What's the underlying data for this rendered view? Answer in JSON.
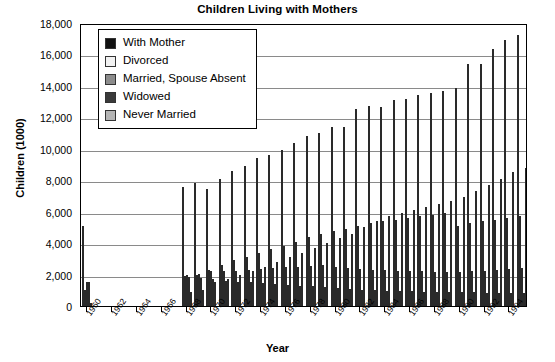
{
  "chart_data": {
    "type": "bar",
    "title": "Children Living with Mothers",
    "xlabel": "Year",
    "ylabel": "Children (1000)",
    "ylim": [
      0,
      18000
    ],
    "ytick_step": 2000,
    "grid": true,
    "legend_position": "top-left-inside",
    "xtick_labels": [
      "1960",
      "1962",
      "1964",
      "1966",
      "1968",
      "1970",
      "1972",
      "1974",
      "1976",
      "1978",
      "1980",
      "1982",
      "1984",
      "1986",
      "1988",
      "1990",
      "1992",
      "1994"
    ],
    "ytick_labels": [
      "0",
      "2,000",
      "4,000",
      "6,000",
      "8,000",
      "10,000",
      "12,000",
      "14,000",
      "16,000",
      "18,000"
    ],
    "x": [
      1960,
      1961,
      1962,
      1963,
      1964,
      1965,
      1966,
      1967,
      1968,
      1969,
      1970,
      1971,
      1972,
      1973,
      1974,
      1975,
      1976,
      1977,
      1978,
      1979,
      1980,
      1981,
      1982,
      1983,
      1984,
      1985,
      1986,
      1987,
      1988,
      1989,
      1990,
      1991,
      1992,
      1993,
      1994,
      1995
    ],
    "colors": {
      "with_mother": "#111111",
      "divorced": "#f2f2f2",
      "married_spouse_absent": "#8c8c8c",
      "widowed": "#3a3a3a",
      "never_married": "#b5b5b5"
    },
    "series": [
      {
        "name": "With Mother",
        "color": "#111111",
        "values": [
          5105,
          null,
          null,
          null,
          null,
          null,
          null,
          null,
          7600,
          7800,
          7452,
          8100,
          8600,
          8900,
          9400,
          9625,
          9900,
          10400,
          10800,
          11000,
          11406,
          11416,
          12512,
          12739,
          12646,
          13081,
          13180,
          13420,
          13521,
          13700,
          13874,
          15396,
          15396,
          16334,
          16896,
          17250
        ]
      },
      {
        "name": "Divorced",
        "color": "#f2f2f2",
        "values": [
          1050,
          null,
          null,
          null,
          null,
          null,
          null,
          null,
          1900,
          2000,
          2296,
          2600,
          2900,
          3100,
          3400,
          3600,
          3800,
          4100,
          4400,
          4600,
          4766,
          4900,
          5100,
          5300,
          5400,
          5500,
          5600,
          5700,
          5800,
          5900,
          5118,
          5300,
          5400,
          5500,
          5600,
          5700
        ]
      },
      {
        "name": "Married, Spouse Absent",
        "color": "#8c8c8c",
        "values": [
          1500,
          null,
          null,
          null,
          null,
          null,
          null,
          null,
          2000,
          2050,
          2223,
          2200,
          2250,
          2300,
          2350,
          2400,
          2450,
          2500,
          2550,
          2600,
          2480,
          2400,
          2350,
          2300,
          2280,
          2250,
          2220,
          2200,
          2180,
          2160,
          2178,
          2200,
          2250,
          2300,
          2350,
          2400
        ]
      },
      {
        "name": "Widowed",
        "color": "#3a3a3a",
        "values": [
          1500,
          null,
          null,
          null,
          null,
          null,
          null,
          null,
          1850,
          1800,
          1688,
          1600,
          1550,
          1500,
          1450,
          1400,
          1350,
          1300,
          1250,
          1200,
          1163,
          1100,
          1050,
          1000,
          980,
          960,
          940,
          920,
          900,
          880,
          874,
          860,
          850,
          840,
          830,
          820
        ]
      },
      {
        "name": "Never Married",
        "color": "#b5b5b5",
        "values": [
          221,
          null,
          null,
          null,
          null,
          null,
          null,
          null,
          900,
          1000,
          1527,
          1700,
          1950,
          2200,
          2500,
          2800,
          3100,
          3400,
          3700,
          4000,
          4296,
          4600,
          5000,
          5400,
          5700,
          5900,
          6100,
          6300,
          6500,
          6700,
          6924,
          7300,
          7700,
          8100,
          8500,
          8800
        ]
      }
    ]
  },
  "legend": {
    "items": [
      {
        "label": "With Mother",
        "color": "#111111"
      },
      {
        "label": "Divorced",
        "color": "#f2f2f2"
      },
      {
        "label": "Married, Spouse Absent",
        "color": "#8c8c8c"
      },
      {
        "label": "Widowed",
        "color": "#3a3a3a"
      },
      {
        "label": "Never Married",
        "color": "#b5b5b5"
      }
    ]
  }
}
